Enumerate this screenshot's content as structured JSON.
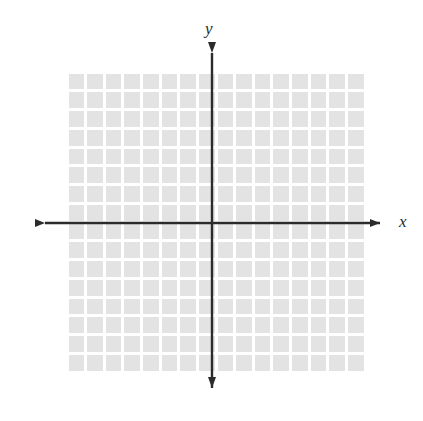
{
  "figure": {
    "title": "",
    "width": 423,
    "height": 421,
    "background_color": "#ffffff"
  },
  "labels": {
    "y_axis": "y",
    "x_axis": "x"
  },
  "chart_data": {
    "type": "scatter",
    "title": "",
    "subtitle": "",
    "xlabel": "x",
    "ylabel": "y",
    "x": [],
    "y": [],
    "series": [],
    "annotations": [],
    "legend": null,
    "legend_position": "none",
    "grid": true,
    "grid_columns": 16,
    "grid_rows": 16,
    "xlim": [
      -8,
      8
    ],
    "ylim": [
      -8,
      8
    ],
    "xticks": [],
    "yticks": [],
    "xtick_labels": [],
    "ytick_labels": [],
    "axis_origin": [
      0,
      0
    ],
    "axis_arrows": [
      "left",
      "right",
      "up",
      "down"
    ]
  },
  "geometry": {
    "grid_left": 67,
    "grid_top": 72,
    "grid_right": 365,
    "grid_bottom": 372,
    "cell_width": 18.625,
    "cell_height": 18.75,
    "origin_x": 212,
    "origin_y": 223,
    "x_axis_start": 35,
    "x_axis_end": 390,
    "y_axis_start": 43,
    "y_axis_end": 398
  },
  "colors": {
    "cell_fill": "#e3e3e3",
    "grid_line": "#ffffff",
    "axis": "#2b2b2b",
    "label": "#2b2b2b",
    "background": "#ffffff"
  }
}
